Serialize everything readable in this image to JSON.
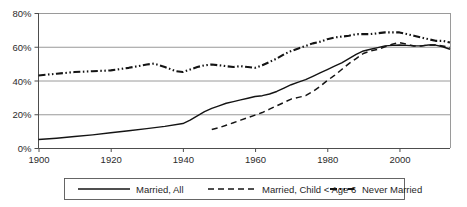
{
  "chart_data": {
    "type": "line",
    "title": "",
    "xlabel": "",
    "ylabel": "",
    "xlim": [
      1900,
      2014
    ],
    "ylim": [
      0,
      0.8
    ],
    "grid": true,
    "legend_position": "bottom",
    "x_ticks": [
      "1900",
      "1920",
      "1940",
      "1960",
      "1980",
      "2000"
    ],
    "x_tick_values": [
      1900,
      1920,
      1940,
      1960,
      1980,
      2000
    ],
    "y_ticks": [
      "0%",
      "20%",
      "40%",
      "60%",
      "80%"
    ],
    "y_tick_values": [
      0,
      20,
      40,
      60,
      80
    ],
    "series": [
      {
        "name": "Married, All",
        "style": "solid",
        "x": [
          1900,
          1905,
          1910,
          1915,
          1920,
          1925,
          1930,
          1935,
          1940,
          1942,
          1944,
          1946,
          1948,
          1950,
          1952,
          1954,
          1956,
          1958,
          1960,
          1962,
          1964,
          1966,
          1968,
          1970,
          1972,
          1974,
          1976,
          1978,
          1980,
          1982,
          1984,
          1986,
          1988,
          1990,
          1992,
          1994,
          1996,
          1998,
          2000,
          2002,
          2004,
          2006,
          2008,
          2010,
          2012,
          2014
        ],
        "values": [
          5.0,
          5.8,
          6.8,
          7.8,
          9.0,
          10.2,
          11.5,
          12.8,
          14.5,
          16.5,
          19.0,
          21.5,
          23.5,
          25.0,
          26.5,
          27.5,
          28.5,
          29.5,
          30.5,
          31.0,
          32.0,
          33.5,
          35.5,
          37.5,
          39.0,
          40.5,
          42.5,
          44.5,
          46.5,
          48.5,
          50.5,
          53.0,
          55.5,
          57.5,
          58.5,
          59.5,
          60.5,
          60.8,
          61.0,
          60.8,
          60.5,
          60.5,
          61.0,
          61.0,
          60.0,
          58.5
        ]
      },
      {
        "name": "Married, Child < Age 6",
        "style": "dashed",
        "x": [
          1948,
          1950,
          1952,
          1954,
          1956,
          1958,
          1960,
          1962,
          1964,
          1966,
          1968,
          1970,
          1972,
          1974,
          1976,
          1978,
          1980,
          1982,
          1984,
          1986,
          1988,
          1990,
          1992,
          1994,
          1996,
          1998,
          2000,
          2002,
          2004,
          2006,
          2008,
          2010,
          2012,
          2014
        ],
        "values": [
          11.0,
          12.0,
          13.5,
          15.0,
          16.5,
          18.0,
          19.5,
          21.0,
          23.0,
          25.0,
          27.0,
          29.0,
          30.0,
          31.0,
          33.5,
          36.5,
          40.0,
          43.0,
          46.5,
          50.0,
          53.0,
          56.0,
          57.5,
          58.5,
          60.0,
          61.5,
          62.5,
          61.5,
          60.5,
          60.5,
          61.0,
          61.0,
          60.5,
          59.5
        ]
      },
      {
        "name": "Never Married",
        "style": "dash-dot-dot",
        "x": [
          1900,
          1905,
          1910,
          1915,
          1920,
          1925,
          1930,
          1932,
          1935,
          1938,
          1940,
          1942,
          1944,
          1946,
          1948,
          1950,
          1952,
          1954,
          1956,
          1958,
          1960,
          1962,
          1964,
          1966,
          1968,
          1970,
          1972,
          1974,
          1976,
          1978,
          1980,
          1982,
          1984,
          1986,
          1988,
          1990,
          1992,
          1994,
          1996,
          1998,
          2000,
          2002,
          2004,
          2006,
          2008,
          2010,
          2012,
          2014
        ],
        "values": [
          43.0,
          44.0,
          45.0,
          45.5,
          46.0,
          47.5,
          49.5,
          50.0,
          48.0,
          45.5,
          45.0,
          46.5,
          48.0,
          49.0,
          49.5,
          49.0,
          48.5,
          48.0,
          48.5,
          48.0,
          47.5,
          49.0,
          51.0,
          53.0,
          55.5,
          57.5,
          59.0,
          60.5,
          62.0,
          63.0,
          64.5,
          65.5,
          66.0,
          66.5,
          67.5,
          67.5,
          67.5,
          68.0,
          68.5,
          68.5,
          68.5,
          67.5,
          66.5,
          65.5,
          64.5,
          63.5,
          63.5,
          62.5
        ]
      }
    ]
  },
  "legend": {
    "items": [
      {
        "label": "Married, All",
        "style": "solid"
      },
      {
        "label": "Married, Child < Age 6",
        "style": "dashed"
      },
      {
        "label": "Never Married",
        "style": "dash-dot-dot"
      }
    ]
  },
  "colors": {
    "line": "#141414",
    "grid": "#808080",
    "axis": "#4d4d4d",
    "text": "#1f1f1f",
    "background": "#ffffff"
  }
}
